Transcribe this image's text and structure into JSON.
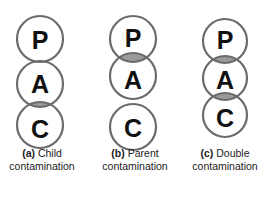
{
  "diagram": {
    "colors": {
      "ring": "#6b6b6b",
      "overlap": "#9a9a9a",
      "text": "#111111"
    },
    "panels": [
      {
        "id": "a",
        "nodes": [
          {
            "label": "P",
            "cy": 39
          },
          {
            "label": "A",
            "cy": 84
          },
          {
            "label": "C",
            "cy": 125
          }
        ],
        "contaminated_overlap": [
          "A-C"
        ],
        "caption_prefix": "(a)",
        "caption_line1": "Child",
        "caption_line2": "contamination"
      },
      {
        "id": "b",
        "nodes": [
          {
            "label": "P",
            "cy": 39
          },
          {
            "label": "A",
            "cy": 76
          },
          {
            "label": "C",
            "cy": 127
          }
        ],
        "contaminated_overlap": [
          "P-A"
        ],
        "caption_prefix": "(b)",
        "caption_line1": "Parent",
        "caption_line2": "contamination"
      },
      {
        "id": "c",
        "nodes": [
          {
            "label": "P",
            "cy": 41
          },
          {
            "label": "A",
            "cy": 78
          },
          {
            "label": "C",
            "cy": 115
          }
        ],
        "contaminated_overlap": [
          "P-A",
          "A-C"
        ],
        "caption_prefix": "(c)",
        "caption_line1": "Double",
        "caption_line2": "contamination"
      }
    ]
  }
}
